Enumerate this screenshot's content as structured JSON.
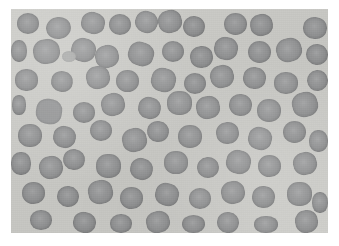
{
  "page": {
    "width": 339,
    "height": 246,
    "background_color": "#ffffff",
    "content_type": "light-microscopy-image"
  },
  "micrograph": {
    "label": "blood-smear-micrograph",
    "frame": {
      "x": 11,
      "y": 9,
      "width": 317,
      "height": 224
    },
    "field_background_color": "#cdcdc9",
    "field_background_gradient_color": "#c6c6c2",
    "cell_fill_color": "#8f9091",
    "cell_rim_color": "#6f7072",
    "pale_cell_fill_color": "#a9aaa9",
    "cell_count": 78,
    "cell_type": "erythrocyte",
    "colorization": "grayscale"
  },
  "cells": [
    {
      "x": 17,
      "y": 13,
      "w": 22,
      "h": 21,
      "r": 49,
      "t": 0,
      "s": 0.0,
      "k": "rbc"
    },
    {
      "x": 46,
      "y": 17,
      "w": 25,
      "h": 22,
      "r": 50,
      "t": -8,
      "s": 0.03,
      "k": "rbc"
    },
    {
      "x": 81,
      "y": 12,
      "w": 24,
      "h": 22,
      "r": 47,
      "t": 12,
      "s": 0.01,
      "k": "rbc"
    },
    {
      "x": 109,
      "y": 14,
      "w": 22,
      "h": 21,
      "r": 50,
      "t": 0,
      "s": -0.02,
      "k": "rbc"
    },
    {
      "x": 135,
      "y": 11,
      "w": 23,
      "h": 22,
      "r": 48,
      "t": 20,
      "s": 0.04,
      "k": "rbc"
    },
    {
      "x": 158,
      "y": 10,
      "w": 24,
      "h": 23,
      "r": 46,
      "t": -14,
      "s": 0.02,
      "k": "rbc"
    },
    {
      "x": 183,
      "y": 16,
      "w": 22,
      "h": 21,
      "r": 50,
      "t": 5,
      "s": 0.0,
      "k": "rbc"
    },
    {
      "x": 224,
      "y": 13,
      "w": 23,
      "h": 22,
      "r": 49,
      "t": 0,
      "s": 0.03,
      "k": "rbc"
    },
    {
      "x": 250,
      "y": 14,
      "w": 23,
      "h": 22,
      "r": 47,
      "t": -10,
      "s": 0.01,
      "k": "rbc"
    },
    {
      "x": 303,
      "y": 17,
      "w": 24,
      "h": 22,
      "r": 48,
      "t": 8,
      "s": 0.02,
      "k": "rbc"
    },
    {
      "x": 11,
      "y": 40,
      "w": 16,
      "h": 22,
      "r": 45,
      "t": 0,
      "s": 0.0,
      "k": "rbc"
    },
    {
      "x": 33,
      "y": 39,
      "w": 27,
      "h": 25,
      "r": 46,
      "t": -6,
      "s": 0.04,
      "k": "rbc"
    },
    {
      "x": 71,
      "y": 38,
      "w": 25,
      "h": 24,
      "r": 48,
      "t": 14,
      "s": 0.02,
      "k": "rbc"
    },
    {
      "x": 62,
      "y": 51,
      "w": 14,
      "h": 11,
      "r": 50,
      "t": 0,
      "s": 0.0,
      "k": "platelet"
    },
    {
      "x": 95,
      "y": 45,
      "w": 24,
      "h": 23,
      "r": 47,
      "t": -12,
      "s": 0.03,
      "k": "rbc"
    },
    {
      "x": 128,
      "y": 42,
      "w": 26,
      "h": 24,
      "r": 45,
      "t": 18,
      "s": 0.01,
      "k": "rbc"
    },
    {
      "x": 162,
      "y": 41,
      "w": 22,
      "h": 21,
      "r": 50,
      "t": 0,
      "s": 0.02,
      "k": "rbc"
    },
    {
      "x": 190,
      "y": 46,
      "w": 23,
      "h": 22,
      "r": 48,
      "t": -8,
      "s": 0.0,
      "k": "rbc"
    },
    {
      "x": 214,
      "y": 37,
      "w": 24,
      "h": 23,
      "r": 47,
      "t": 10,
      "s": 0.03,
      "k": "rbc"
    },
    {
      "x": 248,
      "y": 41,
      "w": 23,
      "h": 22,
      "r": 49,
      "t": 0,
      "s": 0.01,
      "k": "rbc"
    },
    {
      "x": 276,
      "y": 38,
      "w": 26,
      "h": 24,
      "r": 46,
      "t": -16,
      "s": 0.04,
      "k": "rbc"
    },
    {
      "x": 306,
      "y": 44,
      "w": 22,
      "h": 21,
      "r": 50,
      "t": 6,
      "s": 0.0,
      "k": "rbc"
    },
    {
      "x": 15,
      "y": 69,
      "w": 23,
      "h": 22,
      "r": 47,
      "t": 0,
      "s": 0.02,
      "k": "rbc"
    },
    {
      "x": 51,
      "y": 71,
      "w": 22,
      "h": 21,
      "r": 49,
      "t": 12,
      "s": 0.0,
      "k": "rbc"
    },
    {
      "x": 86,
      "y": 66,
      "w": 24,
      "h": 23,
      "r": 46,
      "t": -10,
      "s": 0.03,
      "k": "rbc"
    },
    {
      "x": 116,
      "y": 70,
      "w": 23,
      "h": 22,
      "r": 48,
      "t": 0,
      "s": 0.01,
      "k": "rbc"
    },
    {
      "x": 151,
      "y": 68,
      "w": 25,
      "h": 24,
      "r": 45,
      "t": 16,
      "s": 0.04,
      "k": "rbc"
    },
    {
      "x": 184,
      "y": 73,
      "w": 22,
      "h": 21,
      "r": 50,
      "t": 0,
      "s": 0.0,
      "k": "rbc"
    },
    {
      "x": 210,
      "y": 65,
      "w": 24,
      "h": 23,
      "r": 47,
      "t": -14,
      "s": 0.02,
      "k": "rbc"
    },
    {
      "x": 243,
      "y": 67,
      "w": 23,
      "h": 22,
      "r": 48,
      "t": 8,
      "s": 0.01,
      "k": "rbc"
    },
    {
      "x": 274,
      "y": 72,
      "w": 24,
      "h": 22,
      "r": 47,
      "t": 0,
      "s": 0.03,
      "k": "rbc"
    },
    {
      "x": 307,
      "y": 70,
      "w": 21,
      "h": 21,
      "r": 50,
      "t": -6,
      "s": 0.0,
      "k": "rbc"
    },
    {
      "x": 12,
      "y": 95,
      "w": 14,
      "h": 20,
      "r": 44,
      "t": 0,
      "s": 0.0,
      "k": "rbc"
    },
    {
      "x": 36,
      "y": 99,
      "w": 26,
      "h": 25,
      "r": 42,
      "t": 10,
      "s": 0.05,
      "k": "echinocyte"
    },
    {
      "x": 73,
      "y": 102,
      "w": 22,
      "h": 21,
      "r": 49,
      "t": 0,
      "s": 0.0,
      "k": "rbc"
    },
    {
      "x": 101,
      "y": 93,
      "w": 24,
      "h": 23,
      "r": 47,
      "t": -12,
      "s": 0.02,
      "k": "rbc"
    },
    {
      "x": 138,
      "y": 97,
      "w": 23,
      "h": 22,
      "r": 48,
      "t": 14,
      "s": 0.01,
      "k": "rbc"
    },
    {
      "x": 167,
      "y": 91,
      "w": 25,
      "h": 24,
      "r": 45,
      "t": 0,
      "s": 0.04,
      "k": "rbc"
    },
    {
      "x": 196,
      "y": 96,
      "w": 24,
      "h": 23,
      "r": 46,
      "t": -9,
      "s": 0.02,
      "k": "rbc"
    },
    {
      "x": 229,
      "y": 94,
      "w": 23,
      "h": 22,
      "r": 49,
      "t": 6,
      "s": 0.0,
      "k": "rbc"
    },
    {
      "x": 257,
      "y": 99,
      "w": 24,
      "h": 23,
      "r": 47,
      "t": 0,
      "s": 0.03,
      "k": "rbc"
    },
    {
      "x": 292,
      "y": 92,
      "w": 26,
      "h": 25,
      "r": 45,
      "t": -15,
      "s": 0.01,
      "k": "rbc"
    },
    {
      "x": 18,
      "y": 124,
      "w": 24,
      "h": 23,
      "r": 47,
      "t": 0,
      "s": 0.02,
      "k": "rbc"
    },
    {
      "x": 53,
      "y": 126,
      "w": 23,
      "h": 22,
      "r": 48,
      "t": 12,
      "s": 0.0,
      "k": "rbc"
    },
    {
      "x": 90,
      "y": 120,
      "w": 22,
      "h": 21,
      "r": 50,
      "t": 0,
      "s": 0.01,
      "k": "rbc"
    },
    {
      "x": 122,
      "y": 128,
      "w": 25,
      "h": 24,
      "r": 46,
      "t": -11,
      "s": 0.03,
      "k": "rbc"
    },
    {
      "x": 147,
      "y": 121,
      "w": 22,
      "h": 21,
      "r": 49,
      "t": 7,
      "s": 0.0,
      "k": "rbc"
    },
    {
      "x": 178,
      "y": 125,
      "w": 24,
      "h": 23,
      "r": 47,
      "t": 0,
      "s": 0.02,
      "k": "rbc"
    },
    {
      "x": 216,
      "y": 122,
      "w": 23,
      "h": 22,
      "r": 48,
      "t": -8,
      "s": 0.01,
      "k": "rbc"
    },
    {
      "x": 248,
      "y": 127,
      "w": 24,
      "h": 23,
      "r": 46,
      "t": 16,
      "s": 0.04,
      "k": "rbc"
    },
    {
      "x": 283,
      "y": 121,
      "w": 23,
      "h": 22,
      "r": 49,
      "t": 0,
      "s": 0.0,
      "k": "rbc"
    },
    {
      "x": 309,
      "y": 130,
      "w": 19,
      "h": 22,
      "r": 46,
      "t": 0,
      "s": 0.02,
      "k": "rbc"
    },
    {
      "x": 11,
      "y": 152,
      "w": 20,
      "h": 23,
      "r": 46,
      "t": 0,
      "s": 0.0,
      "k": "rbc"
    },
    {
      "x": 39,
      "y": 156,
      "w": 24,
      "h": 23,
      "r": 47,
      "t": -10,
      "s": 0.03,
      "k": "rbc"
    },
    {
      "x": 63,
      "y": 149,
      "w": 22,
      "h": 21,
      "r": 49,
      "t": 9,
      "s": 0.0,
      "k": "rbc"
    },
    {
      "x": 96,
      "y": 154,
      "w": 25,
      "h": 24,
      "r": 45,
      "t": 0,
      "s": 0.02,
      "k": "rbc"
    },
    {
      "x": 130,
      "y": 158,
      "w": 23,
      "h": 22,
      "r": 48,
      "t": 13,
      "s": 0.01,
      "k": "rbc"
    },
    {
      "x": 164,
      "y": 151,
      "w": 24,
      "h": 23,
      "r": 46,
      "t": 0,
      "s": 0.04,
      "k": "rbc"
    },
    {
      "x": 197,
      "y": 157,
      "w": 22,
      "h": 21,
      "r": 50,
      "t": -7,
      "s": 0.0,
      "k": "rbc"
    },
    {
      "x": 226,
      "y": 150,
      "w": 25,
      "h": 24,
      "r": 46,
      "t": 11,
      "s": 0.02,
      "k": "rbc"
    },
    {
      "x": 258,
      "y": 155,
      "w": 23,
      "h": 22,
      "r": 48,
      "t": 0,
      "s": 0.01,
      "k": "rbc"
    },
    {
      "x": 293,
      "y": 152,
      "w": 24,
      "h": 23,
      "r": 47,
      "t": -13,
      "s": 0.03,
      "k": "rbc"
    },
    {
      "x": 22,
      "y": 182,
      "w": 23,
      "h": 22,
      "r": 48,
      "t": 0,
      "s": 0.01,
      "k": "rbc"
    },
    {
      "x": 57,
      "y": 186,
      "w": 22,
      "h": 21,
      "r": 50,
      "t": 8,
      "s": 0.0,
      "k": "rbc"
    },
    {
      "x": 88,
      "y": 180,
      "w": 25,
      "h": 24,
      "r": 45,
      "t": -12,
      "s": 0.04,
      "k": "rbc"
    },
    {
      "x": 120,
      "y": 187,
      "w": 23,
      "h": 22,
      "r": 48,
      "t": 0,
      "s": 0.02,
      "k": "rbc"
    },
    {
      "x": 155,
      "y": 183,
      "w": 24,
      "h": 23,
      "r": 46,
      "t": 15,
      "s": 0.0,
      "k": "rbc"
    },
    {
      "x": 189,
      "y": 188,
      "w": 22,
      "h": 21,
      "r": 49,
      "t": 0,
      "s": 0.03,
      "k": "rbc"
    },
    {
      "x": 221,
      "y": 181,
      "w": 24,
      "h": 23,
      "r": 47,
      "t": -9,
      "s": 0.01,
      "k": "rbc"
    },
    {
      "x": 252,
      "y": 186,
      "w": 23,
      "h": 22,
      "r": 48,
      "t": 6,
      "s": 0.0,
      "k": "rbc"
    },
    {
      "x": 287,
      "y": 182,
      "w": 25,
      "h": 24,
      "r": 45,
      "t": 0,
      "s": 0.02,
      "k": "rbc"
    },
    {
      "x": 312,
      "y": 192,
      "w": 16,
      "h": 21,
      "r": 46,
      "t": 0,
      "s": 0.0,
      "k": "rbc"
    },
    {
      "x": 30,
      "y": 210,
      "w": 22,
      "h": 20,
      "r": 48,
      "t": 0,
      "s": 0.01,
      "k": "rbc"
    },
    {
      "x": 73,
      "y": 212,
      "w": 23,
      "h": 21,
      "r": 47,
      "t": 10,
      "s": 0.0,
      "k": "rbc"
    },
    {
      "x": 110,
      "y": 214,
      "w": 22,
      "h": 19,
      "r": 48,
      "t": 0,
      "s": 0.02,
      "k": "rbc"
    },
    {
      "x": 146,
      "y": 211,
      "w": 24,
      "h": 22,
      "r": 46,
      "t": -11,
      "s": 0.03,
      "k": "rbc"
    },
    {
      "x": 182,
      "y": 215,
      "w": 23,
      "h": 18,
      "r": 48,
      "t": 0,
      "s": 0.0,
      "k": "rbc"
    },
    {
      "x": 217,
      "y": 212,
      "w": 22,
      "h": 21,
      "r": 49,
      "t": 7,
      "s": 0.01,
      "k": "rbc"
    },
    {
      "x": 254,
      "y": 216,
      "w": 24,
      "h": 17,
      "r": 47,
      "t": 0,
      "s": 0.02,
      "k": "rbc"
    },
    {
      "x": 295,
      "y": 210,
      "w": 23,
      "h": 23,
      "r": 47,
      "t": -8,
      "s": 0.0,
      "k": "rbc"
    }
  ]
}
